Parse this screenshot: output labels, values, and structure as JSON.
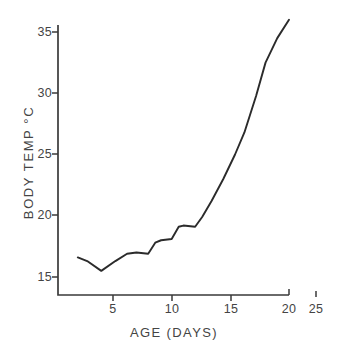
{
  "chart_data": {
    "type": "line",
    "title": "",
    "xlabel": "AGE (DAYS)",
    "ylabel": "BODY TEMP °C",
    "xlim": [
      0,
      26
    ],
    "ylim": [
      13,
      37.5
    ],
    "grid": false,
    "legend": "none",
    "xticks": [
      5,
      10,
      15,
      20,
      25
    ],
    "xtick_labels": [
      "5",
      "10",
      "15",
      "20",
      "25"
    ],
    "yticks": [
      15,
      20,
      25,
      30,
      35
    ],
    "ytick_labels": [
      "15",
      "20",
      "25",
      "30",
      "35"
    ],
    "axis_note": "x-axis spine ends at 20; the 25 tick is detached beyond the spine",
    "series": [
      {
        "name": "body temperature",
        "type": "line",
        "x": [
          2.0,
          2.8,
          4.0,
          5.2,
          6.2,
          7.0,
          8.0,
          8.6,
          9.1,
          10.0,
          10.6,
          11.0,
          12.0,
          12.6,
          13.4,
          14.4,
          15.4,
          16.2,
          17.2,
          18.0,
          19.0,
          20.0
        ],
        "y": [
          16.6,
          16.3,
          15.5,
          16.3,
          16.9,
          17.0,
          16.9,
          17.8,
          18.0,
          18.1,
          19.1,
          19.2,
          19.1,
          19.9,
          21.2,
          23.0,
          25.0,
          26.8,
          29.8,
          32.5,
          34.5,
          36.0
        ]
      },
      {
        "name": "adult value marker",
        "type": "scatter",
        "x": [
          25.0
        ],
        "y": [
          36.8
        ]
      }
    ]
  },
  "axis": {
    "y_title": "BODY TEMP °C",
    "x_title": "AGE (DAYS)"
  },
  "colors": {
    "line": "#2b2b2b",
    "axis": "#3a3a3a",
    "text": "#444444",
    "background": "#ffffff"
  }
}
